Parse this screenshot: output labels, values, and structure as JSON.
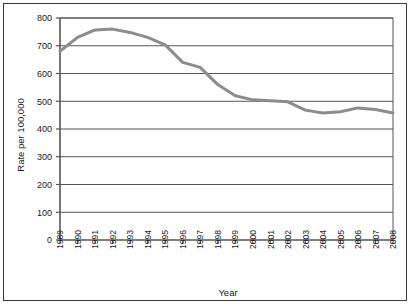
{
  "chart_data": {
    "type": "line",
    "title": "",
    "xlabel": "Year",
    "ylabel": "Rate per 100,000",
    "xlim": [
      1989,
      2008
    ],
    "ylim": [
      0,
      800
    ],
    "yticks": [
      0,
      100,
      200,
      300,
      400,
      500,
      600,
      700,
      800
    ],
    "ytick_labels": [
      "0",
      "100",
      "200",
      "300",
      "400",
      "500",
      "600",
      "700",
      "800"
    ],
    "grid": true,
    "grid_axis": "y",
    "legend": false,
    "line_color": "#8c8c8c",
    "line_width": 3,
    "categories": [
      "1989",
      "1990",
      "1991",
      "1992",
      "1993",
      "1994",
      "1995",
      "1996",
      "1997",
      "1998",
      "1999",
      "2000",
      "2001",
      "2002",
      "2003",
      "2004",
      "2005",
      "2006",
      "2007",
      "2008"
    ],
    "x": [
      1989,
      1990,
      1991,
      1992,
      1993,
      1994,
      1995,
      1996,
      1997,
      1998,
      1999,
      2000,
      2001,
      2002,
      2003,
      2004,
      2005,
      2006,
      2007,
      2008
    ],
    "values": [
      680,
      730,
      757,
      760,
      748,
      730,
      703,
      640,
      622,
      560,
      520,
      505,
      502,
      498,
      468,
      458,
      462,
      476,
      470,
      458
    ]
  },
  "axis": {
    "y_title": "Rate per 100,000",
    "x_title": "Year"
  }
}
